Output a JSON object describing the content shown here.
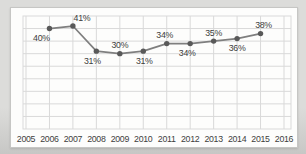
{
  "colors": {
    "page_bg_top": "#dcdcda",
    "page_bg_bottom": "#c7c7c5",
    "panel_bg": "#fdfdfc",
    "panel_border": "#c6c6c4",
    "grid": "#d9d9d9",
    "line": "#7f7f7f",
    "marker": "#595959",
    "text": "#3d3d3d"
  },
  "chart_data": {
    "type": "line",
    "title": "",
    "xlabel": "",
    "ylabel": "",
    "legend": "none",
    "grid": true,
    "ylim": [
      0,
      45
    ],
    "y_gridline_step": 5,
    "y_axis_labels_visible": false,
    "categories": [
      "2005",
      "2006",
      "2007",
      "2008",
      "2009",
      "2010",
      "2011",
      "2012",
      "2013",
      "2014",
      "2015",
      "2016"
    ],
    "series": [
      {
        "name": "percentage-by-year",
        "points": [
          {
            "category": "2006",
            "value": 40,
            "label": "40%",
            "label_pos": "below",
            "label_dx": -8
          },
          {
            "category": "2007",
            "value": 41,
            "label": "41%",
            "label_pos": "above",
            "label_dx": 9
          },
          {
            "category": "2008",
            "value": 31,
            "label": "31%",
            "label_pos": "below",
            "label_dx": -4
          },
          {
            "category": "2009",
            "value": 30,
            "label": "30%",
            "label_pos": "above",
            "label_dx": 0
          },
          {
            "category": "2010",
            "value": 31,
            "label": "31%",
            "label_pos": "below",
            "label_dx": 1
          },
          {
            "category": "2011",
            "value": 34,
            "label": "34%",
            "label_pos": "above",
            "label_dx": -2
          },
          {
            "category": "2012",
            "value": 34,
            "label": "34%",
            "label_pos": "below",
            "label_dx": -3
          },
          {
            "category": "2013",
            "value": 35,
            "label": "35%",
            "label_pos": "above",
            "label_dx": 0
          },
          {
            "category": "2014",
            "value": 36,
            "label": "36%",
            "label_pos": "below",
            "label_dx": 0
          },
          {
            "category": "2015",
            "value": 38,
            "label": "38%",
            "label_pos": "above",
            "label_dx": 3
          }
        ]
      }
    ]
  }
}
